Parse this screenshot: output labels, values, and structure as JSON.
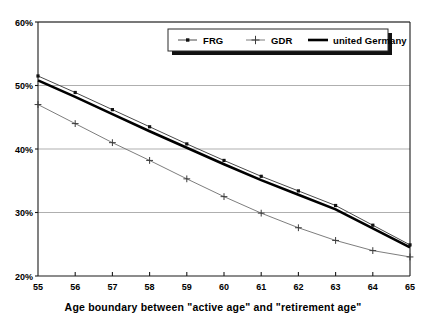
{
  "chart_data": {
    "type": "line",
    "title": "",
    "subtitle": "",
    "xlabel": "Age boundary between \"active age\" and \"retirement age\"",
    "ylabel": "",
    "x": [
      55,
      56,
      57,
      58,
      59,
      60,
      61,
      62,
      63,
      64,
      65
    ],
    "xtick_labels": [
      "55",
      "56",
      "57",
      "58",
      "59",
      "60",
      "61",
      "62",
      "63",
      "64",
      "65"
    ],
    "ytick_labels": [
      "20%",
      "30%",
      "40%",
      "50%",
      "60%"
    ],
    "ytick_values": [
      20,
      30,
      40,
      50,
      60
    ],
    "xlim": [
      55,
      65
    ],
    "ylim": [
      20,
      60
    ],
    "grid": true,
    "legend_position": "top-center",
    "series": [
      {
        "name": "FRG",
        "marker": "square",
        "color": "#4a4a4a",
        "values": [
          51.5,
          48.9,
          46.2,
          43.5,
          40.8,
          38.2,
          35.7,
          33.4,
          31.1,
          28.0,
          24.9
        ]
      },
      {
        "name": "GDR",
        "marker": "plus",
        "color": "#6e6e6e",
        "values": [
          47.0,
          44.0,
          41.0,
          38.2,
          35.3,
          32.5,
          29.9,
          27.6,
          25.6,
          24.0,
          23.0
        ]
      },
      {
        "name": "united Germany",
        "marker": "none",
        "color": "#000000",
        "values": [
          50.8,
          48.2,
          45.5,
          42.8,
          40.2,
          37.6,
          35.1,
          32.8,
          30.5,
          27.5,
          24.5
        ]
      }
    ]
  },
  "legend": {
    "entries": [
      {
        "label": "FRG"
      },
      {
        "label": "GDR"
      },
      {
        "label": "united Germany"
      }
    ]
  },
  "axes": {
    "x_title": "Age boundary between \"active age\" and \"retirement age\"",
    "y_ticks": [
      "60%",
      "50%",
      "40%",
      "30%",
      "20%"
    ],
    "x_ticks": [
      "55",
      "56",
      "57",
      "58",
      "59",
      "60",
      "61",
      "62",
      "63",
      "64",
      "65"
    ]
  },
  "colors": {
    "frg": "#4a4a4a",
    "gdr": "#6e6e6e",
    "united_germany": "#000000",
    "grid": "#8c8c8c",
    "axis": "#1a1a1a",
    "background": "#ffffff"
  }
}
